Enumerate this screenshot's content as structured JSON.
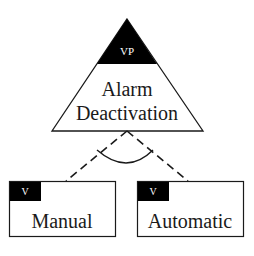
{
  "diagram": {
    "type": "feature-model",
    "variation_point": {
      "tag": "VP",
      "label_line1": "Alarm",
      "label_line2": "Deactivation"
    },
    "relation": "alternative",
    "variants": [
      {
        "tag": "V",
        "label": "Manual"
      },
      {
        "tag": "V",
        "label": "Automatic"
      }
    ],
    "colors": {
      "stroke": "#1a1a1a",
      "tag_fill": "#000000",
      "background": "#ffffff"
    }
  }
}
